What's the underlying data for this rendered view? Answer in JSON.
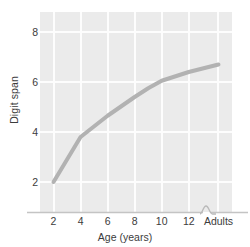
{
  "chart_data": {
    "type": "line",
    "title": "",
    "xlabel": "Age (years)",
    "ylabel": "Digit span",
    "x_tick_labels": [
      "2",
      "4",
      "6",
      "8",
      "10",
      "12",
      "Adults"
    ],
    "y_tick_labels": [
      "2",
      "4",
      "6",
      "8"
    ],
    "y_ticks": [
      2,
      4,
      6,
      8
    ],
    "ylim": [
      0.8,
      8.8
    ],
    "xlim": [
      "1",
      "Adults"
    ],
    "grid": true,
    "gridline_color": "#fdfdfd",
    "plot_background": "#ebebeb",
    "legend": "none",
    "axis_break": {
      "present": true,
      "location": "x-axis between 12 and Adults",
      "symbol": "squiggle"
    },
    "series": [
      {
        "name": "Digit span",
        "color": "#b2b2b2",
        "line_width": 4,
        "x": [
          "2",
          "4",
          "6",
          "8",
          "9",
          "10",
          "12",
          "Adults"
        ],
        "x_positions": [
          2,
          4,
          6,
          8,
          9,
          10,
          12,
          14.2
        ],
        "values": [
          2.0,
          3.8,
          4.65,
          5.4,
          5.75,
          6.05,
          6.4,
          6.7
        ]
      }
    ]
  },
  "axis": {
    "x_tick_values": [
      2,
      4,
      6,
      8,
      10,
      12,
      14.2
    ],
    "y_label_text": "Digit span",
    "x_label_text": "Age (years)"
  },
  "colors": {
    "line": "#b2b2b2",
    "plot_bg": "#ebebeb",
    "grid": "#fdfdfd",
    "text": "#3c3c3c",
    "axis": "#c9c9c9"
  }
}
